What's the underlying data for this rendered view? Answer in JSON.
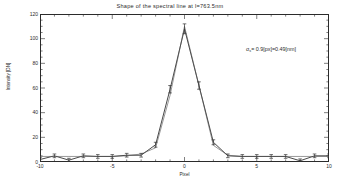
{
  "chart_data": {
    "type": "line",
    "title": "Shape of the spectral line at l=763.5nm",
    "xlabel": "Pixel",
    "ylabel": "Intensity [DN]",
    "xlim": [
      -10,
      10
    ],
    "ylim": [
      0,
      120
    ],
    "xticks": [
      -10,
      -5,
      0,
      5,
      10
    ],
    "xticklabels": [
      "-10",
      "-5",
      "0",
      "5",
      "10"
    ],
    "yticks": [
      0,
      20,
      40,
      60,
      80,
      100,
      120
    ],
    "yticklabels": [
      "0",
      "20",
      "40",
      "60",
      "80",
      "100",
      "120"
    ],
    "grid": false,
    "legend": "none",
    "annotations": [
      {
        "text_sigma": "σ",
        "text_sub": "s",
        "text_rest": "= 0.9[px]=0.49[nm]",
        "x": 246,
        "y": 46
      }
    ],
    "x": [
      -10,
      -9,
      -8,
      -7,
      -6,
      -5,
      -4,
      -3,
      -2,
      -1,
      0,
      1,
      2,
      3,
      4,
      5,
      6,
      7,
      8,
      9,
      10
    ],
    "series": [
      {
        "name": "measured",
        "marker": "error-bar",
        "color": "#333333",
        "values": [
          2.0,
          5.0,
          1.5,
          5.0,
          4.5,
          4.5,
          5.5,
          5.5,
          14.0,
          59.0,
          108.0,
          62.0,
          16.0,
          5.0,
          4.5,
          4.5,
          4.5,
          4.5,
          1.0,
          5.0,
          5.0
        ],
        "errors": [
          1.5,
          1.5,
          1.5,
          1.5,
          1.5,
          1.5,
          1.5,
          1.5,
          2.0,
          3.0,
          4.0,
          3.0,
          2.0,
          1.5,
          1.5,
          1.5,
          1.5,
          1.5,
          1.5,
          1.5,
          1.5
        ]
      },
      {
        "name": "fit",
        "marker": "none",
        "color": "#555555",
        "values": [
          4.5,
          4.5,
          4.5,
          4.5,
          4.5,
          4.5,
          5.0,
          6.5,
          11.5,
          54.0,
          110.0,
          62.0,
          13.5,
          5.5,
          4.5,
          4.5,
          4.5,
          4.5,
          4.5,
          4.5,
          4.5
        ]
      }
    ]
  }
}
